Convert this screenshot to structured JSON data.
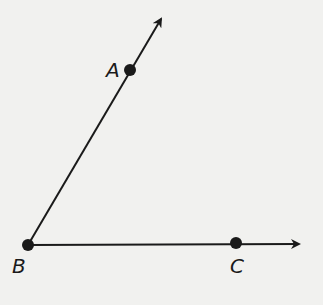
{
  "diagram": {
    "type": "angle",
    "name": "angle ABC",
    "vertex": "B",
    "points": {
      "A": {
        "label": "A",
        "x": 130,
        "y": 70
      },
      "B": {
        "label": "B",
        "x": 28,
        "y": 245
      },
      "C": {
        "label": "C",
        "x": 236,
        "y": 244
      }
    },
    "rays": [
      {
        "name": "ray BA",
        "from": "B",
        "through": "A"
      },
      {
        "name": "ray BC",
        "from": "B",
        "through": "C"
      }
    ],
    "colors": {
      "line": "#1a1a1a",
      "background": "#f1f1ef"
    }
  }
}
